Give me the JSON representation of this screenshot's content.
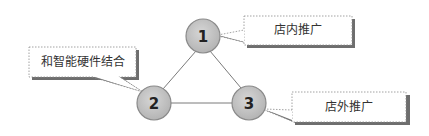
{
  "diagram": {
    "type": "triangle-cycle",
    "nodes": [
      {
        "id": "1",
        "label": "1",
        "cx": 203,
        "cy": 36
      },
      {
        "id": "2",
        "label": "2",
        "cx": 154,
        "cy": 103
      },
      {
        "id": "3",
        "label": "3",
        "cx": 249,
        "cy": 103
      }
    ],
    "edges": [
      {
        "from": "1",
        "to": "2"
      },
      {
        "from": "2",
        "to": "3"
      },
      {
        "from": "3",
        "to": "1"
      }
    ],
    "callouts": [
      {
        "node": "1",
        "text": "店内推广"
      },
      {
        "node": "2",
        "text": "和智能硬件结合"
      },
      {
        "node": "3",
        "text": "店外推广"
      }
    ],
    "colors": {
      "node_fill": "#c4c4c4",
      "node_stroke": "#8a8a8a",
      "edge": "#7a7a7a",
      "callout_border": "#8c8c8c",
      "callout_shadow": "#6e6e6e"
    }
  }
}
